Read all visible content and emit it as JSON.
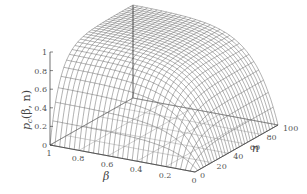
{
  "chart_data": {
    "type": "surface3d",
    "title": "",
    "xlabel": "β",
    "ylabel": "n",
    "zlabel": "p_c(β, n)",
    "x_ticks": [
      "1",
      "0.8",
      "0.6",
      "0.4",
      "0.2",
      "0"
    ],
    "x_tick_values": [
      1,
      0.8,
      0.6,
      0.4,
      0.2,
      0
    ],
    "y_ticks": [
      "0",
      "20",
      "40",
      "60",
      "80",
      "100"
    ],
    "y_tick_values": [
      0,
      20,
      40,
      60,
      80,
      100
    ],
    "z_ticks": [
      "0",
      "0.2",
      "0.4",
      "0.6",
      "0.8",
      "1"
    ],
    "z_tick_values": [
      0,
      0.2,
      0.4,
      0.6,
      0.8,
      1
    ],
    "xlim": [
      0,
      1
    ],
    "ylim": [
      0,
      100
    ],
    "zlim": [
      0,
      1
    ],
    "grid": true,
    "style": "wireframe mesh",
    "mesh_resolution": {
      "beta_lines": 30,
      "n_lines": 30
    }
  },
  "labels": {
    "z_axis": "p",
    "z_axis_sub": "c",
    "z_axis_args": "(β, n)",
    "x_axis": "β",
    "y_axis": "n"
  }
}
